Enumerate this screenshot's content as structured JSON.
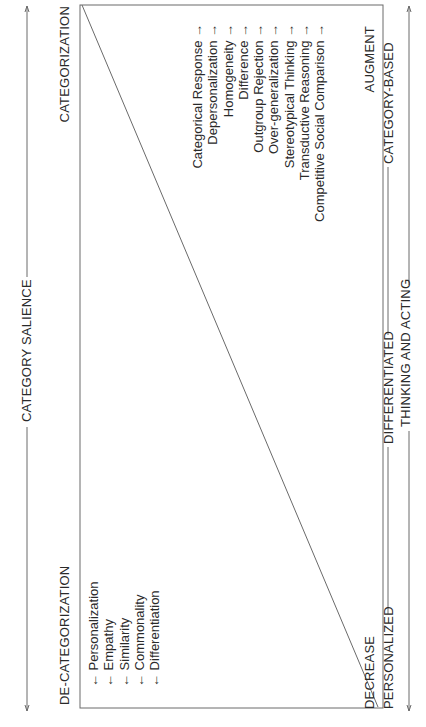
{
  "axis_top": {
    "label": "CATEGORY SALIENCE",
    "left_end_label": "DE-CATEGORIZATION",
    "right_end_label": "CATEGORIZATION"
  },
  "left_items": [
    "← Personalization",
    "← Empathy",
    "← Similarity",
    "← Commonality",
    "← Differentiation"
  ],
  "right_items": [
    "Categorical Response →",
    "Depersonalization →",
    "Homogeneity →",
    "Difference →",
    "Outgroup Rejection →",
    "Over-generalization →",
    "Stereotypical Thinking →",
    "Transductive Reasoning →",
    "Competitive Social Comparison →"
  ],
  "box_bottom": {
    "left_label": "DECREASE",
    "right_label": "AUGMENT"
  },
  "axis_bottom": {
    "left_label": "PERSONALIZED",
    "middle_label": "DIFFERENTIATED",
    "right_label": "CATEGORY-BASED",
    "caption": "THINKING AND ACTING"
  },
  "colors": {
    "line": "#6a6a6a",
    "text": "#2a2a2a",
    "background": "#ffffff"
  }
}
